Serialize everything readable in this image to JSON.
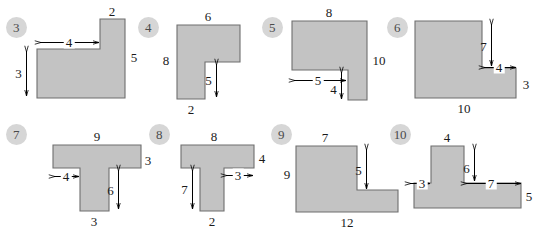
{
  "worksheet": {
    "background_color": "#ffffff",
    "shape_fill": "#c3c3c3",
    "shape_stroke": "#6e6e6e",
    "badge_fill": "#d6d6d6",
    "badge_text_color": "#4a4a4a",
    "label_color": "#1a1a1a"
  },
  "problems": [
    {
      "number": "3",
      "shape": "L-shape",
      "badge": {
        "x": 16,
        "y": 27
      },
      "origin": {
        "x": 0,
        "y": 0
      },
      "polygon": "37,49 100,49 100,19 125,19 125,98 37,98",
      "labels": [
        {
          "text": "2",
          "x": 112,
          "y": 11,
          "arrow": "none"
        },
        {
          "text": "4",
          "x": 69,
          "y": 42,
          "arrow": "horizontal",
          "span_from": 40,
          "span_to": 99
        },
        {
          "text": "5",
          "x": 134,
          "y": 57,
          "arrow": "none"
        },
        {
          "text": "3",
          "x": 26,
          "y": 73,
          "arrow": "vertical",
          "span_from": 51,
          "span_to": 96
        }
      ]
    },
    {
      "number": "4",
      "shape": "inverted-L-shape",
      "badge": {
        "x": 148,
        "y": 27
      },
      "origin": {
        "x": 0,
        "y": 0
      },
      "polygon": "177,25 240,25 240,62 205,62 205,99 177,99",
      "labels": [
        {
          "text": "6",
          "x": 208,
          "y": 16,
          "arrow": "none"
        },
        {
          "text": "8",
          "x": 166,
          "y": 60,
          "arrow": "none"
        },
        {
          "text": "5",
          "x": 216,
          "y": 80,
          "arrow": "vertical",
          "span_from": 64,
          "span_to": 97
        },
        {
          "text": "2",
          "x": 191,
          "y": 109,
          "arrow": "none"
        }
      ]
    },
    {
      "number": "5",
      "shape": "notched-rectangle",
      "badge": {
        "x": 272,
        "y": 27
      },
      "origin": {
        "x": 0,
        "y": 0
      },
      "polygon": "292,21 367,21 367,100 348,100 348,70 292,70",
      "labels": [
        {
          "text": "8",
          "x": 329,
          "y": 12,
          "arrow": "none"
        },
        {
          "text": "10",
          "x": 379,
          "y": 60,
          "arrow": "none"
        },
        {
          "text": "5",
          "x": 318,
          "y": 80,
          "arrow": "horizontal",
          "span_from": 294,
          "span_to": 346
        },
        {
          "text": "4",
          "x": 341,
          "y": 89,
          "arrow": "vertical",
          "span_from": 72,
          "span_to": 99
        }
      ]
    },
    {
      "number": "6",
      "shape": "L-shape-notch-top-right",
      "badge": {
        "x": 397,
        "y": 27
      },
      "origin": {
        "x": 0,
        "y": 0
      },
      "polygon": "415,21 482,21 482,68 516,68 516,98 415,98",
      "labels": [
        {
          "text": "7",
          "x": 491,
          "y": 46,
          "arrow": "vertical",
          "span_from": 24,
          "span_to": 66
        },
        {
          "text": "4",
          "x": 499,
          "y": 67,
          "arrow": "horizontal",
          "span_from": 484,
          "span_to": 516
        },
        {
          "text": "3",
          "x": 526,
          "y": 84,
          "arrow": "none"
        },
        {
          "text": "10",
          "x": 464,
          "y": 108,
          "arrow": "none"
        }
      ]
    },
    {
      "number": "7",
      "shape": "T-shape",
      "badge": {
        "x": 16,
        "y": 134
      },
      "origin": {
        "x": 0,
        "y": 0
      },
      "polygon": "53,145 141,145 141,168 109,168 109,211 80,211 80,168 53,168",
      "labels": [
        {
          "text": "9",
          "x": 97,
          "y": 136,
          "arrow": "none"
        },
        {
          "text": "3",
          "x": 148,
          "y": 160,
          "arrow": "none"
        },
        {
          "text": "4",
          "x": 66,
          "y": 176,
          "arrow": "horizontal",
          "span_from": 54,
          "span_to": 79
        },
        {
          "text": "6",
          "x": 118,
          "y": 190,
          "arrow": "vertical",
          "span_from": 170,
          "span_to": 209
        },
        {
          "text": "3",
          "x": 94,
          "y": 221,
          "arrow": "none"
        }
      ]
    },
    {
      "number": "8",
      "shape": "T-shape",
      "badge": {
        "x": 159,
        "y": 134
      },
      "origin": {
        "x": 0,
        "y": 0
      },
      "polygon": "181,145 254,145 254,168 224,168 224,211 200,211 200,168 181,168",
      "labels": [
        {
          "text": "8",
          "x": 214,
          "y": 136,
          "arrow": "none"
        },
        {
          "text": "4",
          "x": 262,
          "y": 158,
          "arrow": "none"
        },
        {
          "text": "3",
          "x": 238,
          "y": 175,
          "arrow": "horizontal",
          "span_from": 226,
          "span_to": 253
        },
        {
          "text": "7",
          "x": 192,
          "y": 189,
          "arrow": "vertical",
          "span_from": 170,
          "span_to": 209
        },
        {
          "text": "2",
          "x": 212,
          "y": 221,
          "arrow": "none"
        }
      ]
    },
    {
      "number": "9",
      "shape": "L-shape",
      "badge": {
        "x": 281,
        "y": 134
      },
      "origin": {
        "x": 0,
        "y": 0
      },
      "polygon": "296,146 357,146 357,190 398,190 398,212 296,212",
      "labels": [
        {
          "text": "7",
          "x": 325,
          "y": 137,
          "arrow": "none"
        },
        {
          "text": "5",
          "x": 366,
          "y": 170,
          "arrow": "vertical",
          "span_from": 149,
          "span_to": 189
        },
        {
          "text": "9",
          "x": 287,
          "y": 174,
          "arrow": "none"
        },
        {
          "text": "12",
          "x": 347,
          "y": 222,
          "arrow": "none"
        }
      ]
    },
    {
      "number": "10",
      "shape": "inverted-T-shape",
      "badge": {
        "x": 400,
        "y": 134
      },
      "origin": {
        "x": 0,
        "y": 0
      },
      "polygon": "431,146 464,146 464,183 521,183 521,208 414,208 414,183 431,183",
      "labels": [
        {
          "text": "4",
          "x": 447,
          "y": 137,
          "arrow": "none"
        },
        {
          "text": "6",
          "x": 474,
          "y": 168,
          "arrow": "vertical",
          "span_from": 149,
          "span_to": 181
        },
        {
          "text": "3",
          "x": 422,
          "y": 183,
          "arrow": "horizontal",
          "span_from": 410,
          "span_to": 430
        },
        {
          "text": "7",
          "x": 491,
          "y": 183,
          "arrow": "horizontal",
          "span_from": 466,
          "span_to": 521
        },
        {
          "text": "5",
          "x": 529,
          "y": 196,
          "arrow": "none"
        }
      ]
    }
  ]
}
